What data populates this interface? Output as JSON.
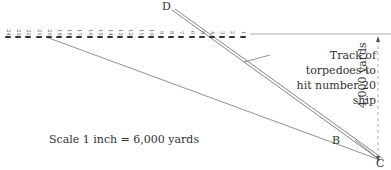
{
  "diagram": {
    "labels": {
      "D": "D",
      "B": "B",
      "C": "C"
    },
    "track_caption": [
      "Track of torpedoes to",
      "hit number 20 ship"
    ],
    "distance_label": "4,000 yards",
    "scale_label": "Scale 1 inch = 6,000 yards",
    "ships": [
      "24",
      "23",
      "22",
      "21",
      "20",
      "19",
      "18",
      "17",
      "16",
      "15",
      "14",
      "13",
      "12",
      "11",
      "10",
      "9",
      "8",
      "7",
      "6",
      "5",
      "4",
      "3",
      "2",
      "1"
    ],
    "target_ship": "20"
  }
}
